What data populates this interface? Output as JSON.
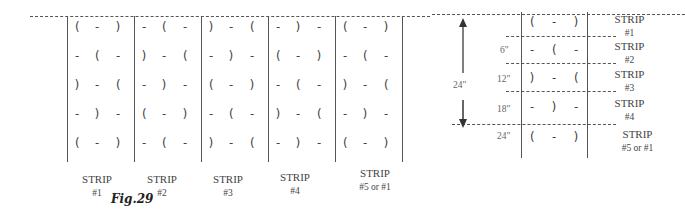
{
  "figure": {
    "caption": "Fig.29",
    "left_grid": {
      "strips": [
        {
          "label": "STRIP",
          "number": "#1",
          "rows": [
            [
              "(",
              "-",
              ")"
            ],
            [
              "-",
              "(",
              "-"
            ],
            [
              ")",
              "-",
              "("
            ],
            [
              "-",
              ")",
              "-"
            ],
            [
              "(",
              "-",
              ")"
            ]
          ]
        },
        {
          "label": "STRIP",
          "number": "#2",
          "rows": [
            [
              "-",
              "(",
              "-"
            ],
            [
              ")",
              "-",
              "("
            ],
            [
              "-",
              ")",
              "-"
            ],
            [
              "(",
              "-",
              ")"
            ],
            [
              "-",
              "(",
              "-"
            ]
          ]
        },
        {
          "label": "STRIP",
          "number": "#3",
          "rows": [
            [
              ")",
              "-",
              "("
            ],
            [
              "-",
              ")",
              "-"
            ],
            [
              "(",
              "-",
              ")"
            ],
            [
              "-",
              "(",
              "-"
            ],
            [
              ")",
              "-",
              "("
            ]
          ]
        },
        {
          "label": "STRIP",
          "number": "#4",
          "rows": [
            [
              "-",
              ")",
              "-"
            ],
            [
              "(",
              "-",
              ")"
            ],
            [
              "-",
              "(",
              "-"
            ],
            [
              ")",
              "-",
              "("
            ],
            [
              "-",
              ")",
              "-"
            ]
          ]
        },
        {
          "label": "STRIP",
          "number": "#5 or #1",
          "rows": [
            [
              "(",
              "-",
              ")"
            ],
            [
              "-",
              "(",
              "-"
            ],
            [
              ")",
              "-",
              "("
            ],
            [
              "-",
              ")",
              "-"
            ],
            [
              "(",
              "-",
              ")"
            ]
          ]
        }
      ]
    },
    "right_detail": {
      "span_label": "24\"",
      "measurements": [
        "6\"",
        "12\"",
        "18\"",
        "24\""
      ],
      "rows": [
        [
          "(",
          "-",
          ")"
        ],
        [
          "-",
          "(",
          "-"
        ],
        [
          ")",
          "-",
          "("
        ],
        [
          "-",
          ")",
          "-"
        ],
        [
          "(",
          "-",
          ")"
        ]
      ],
      "strip_labels": [
        {
          "label": "STRIP",
          "number": "#1"
        },
        {
          "label": "STRIP",
          "number": "#2"
        },
        {
          "label": "STRIP",
          "number": "#3"
        },
        {
          "label": "STRIP",
          "number": "#4"
        },
        {
          "label": "STRIP",
          "number": "#5 or #1"
        }
      ]
    }
  }
}
